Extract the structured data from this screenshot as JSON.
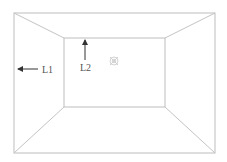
{
  "diagram": {
    "type": "room-perspective",
    "labels": {
      "l1": "L1",
      "l2": "L2"
    },
    "colors": {
      "line": "#bdbdbd",
      "arrow": "#333333",
      "text": "#555555",
      "target": "#c8c8c8",
      "background": "#ffffff"
    },
    "outer_rect": {
      "x1": 14,
      "y1": 13,
      "x2": 215,
      "y2": 153
    },
    "inner_rect": {
      "x1": 64,
      "y1": 38,
      "x2": 165,
      "y2": 107
    },
    "annotations": [
      {
        "id": "L1",
        "text": "L1",
        "arrow_direction": "left",
        "arrow_from": [
          38,
          69
        ],
        "arrow_to": [
          17,
          69
        ],
        "text_pos": [
          42,
          73
        ]
      },
      {
        "id": "L2",
        "text": "L2",
        "arrow_direction": "up",
        "arrow_from": [
          85,
          60
        ],
        "arrow_to": [
          85,
          40
        ],
        "text_pos": [
          80,
          71
        ]
      }
    ],
    "target_marker": {
      "icon": "crosshair-target-icon",
      "cx": 114,
      "cy": 61,
      "r": 4
    }
  }
}
